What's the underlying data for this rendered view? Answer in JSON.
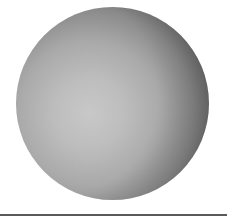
{
  "scene": {
    "description": "Shaded gray sphere above a horizontal baseline",
    "sphere": {
      "shape": "sphere",
      "center": [
        112,
        104
      ],
      "radius": 96,
      "highlight_color": "#c8c8c8",
      "shadow_color": "#2a2a2a"
    },
    "baseline": {
      "y": 215,
      "color": "#5a5a5a"
    },
    "background_color": "#ffffff"
  }
}
